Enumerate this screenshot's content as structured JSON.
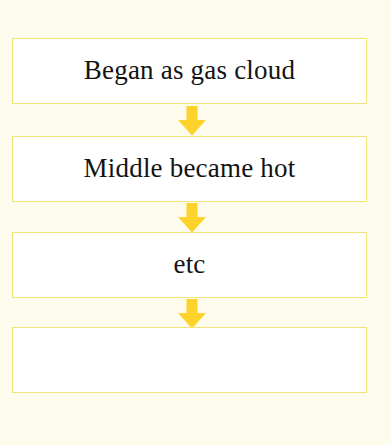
{
  "diagram": {
    "background_color": "#FDFCEC",
    "box_fill_color": "#FFFFFF",
    "box_border_color": "#EFE379",
    "arrow_color": "#FCD22B",
    "text_color": "#131313",
    "nodes": [
      {
        "id": "node-1",
        "label": "Began as gas cloud"
      },
      {
        "id": "node-2",
        "label": "Middle became hot"
      },
      {
        "id": "node-3",
        "label": "etc"
      },
      {
        "id": "node-4",
        "label": ""
      }
    ],
    "connectors": [
      {
        "id": "arrow-1",
        "icon": "arrow-down-icon",
        "from": "node-1",
        "to": "node-2"
      },
      {
        "id": "arrow-2",
        "icon": "arrow-down-icon",
        "from": "node-2",
        "to": "node-3"
      },
      {
        "id": "arrow-3",
        "icon": "arrow-down-icon",
        "from": "node-3",
        "to": "node-4"
      }
    ]
  }
}
